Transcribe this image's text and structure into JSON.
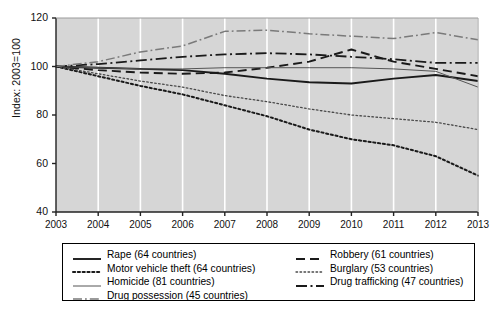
{
  "chart_data": {
    "type": "line",
    "title": "",
    "xlabel": "",
    "ylabel": "Index: 2003=100",
    "xlim": [
      2003,
      2013
    ],
    "ylim": [
      40,
      120
    ],
    "yticks": [
      40,
      60,
      80,
      100,
      120
    ],
    "grid": "vertical-white-gridlines",
    "legend_position": "below-plot",
    "x": [
      2003,
      2004,
      2005,
      2006,
      2007,
      2008,
      2009,
      2010,
      2011,
      2012,
      2013
    ],
    "categories": [
      "2003",
      "2004",
      "2005",
      "2006",
      "2007",
      "2008",
      "2009",
      "2010",
      "2011",
      "2012",
      "2013"
    ],
    "series": [
      {
        "name": "Rape (64 countries)",
        "label": "Rape (64 countries)",
        "countries": 64,
        "style": "solid-thick",
        "color": "#1a1a1a",
        "values": [
          100,
          99.5,
          99,
          98.5,
          97,
          95,
          93.5,
          93,
          95,
          96.5,
          94
        ]
      },
      {
        "name": "Robbery (61 countries)",
        "label": "Robbery (61 countries)",
        "countries": 61,
        "style": "long-dash",
        "color": "#1a1a1a",
        "values": [
          100,
          98.5,
          97.5,
          97,
          97.5,
          99.5,
          102,
          107,
          102,
          99,
          96
        ]
      },
      {
        "name": "Motor vehicle theft (64 countries)",
        "label": "Motor vehicle theft (64 countries)",
        "countries": 64,
        "style": "dotted-thick",
        "color": "#1a1a1a",
        "values": [
          100,
          96,
          92,
          88.5,
          84,
          79.5,
          74,
          70,
          67.5,
          63,
          55
        ]
      },
      {
        "name": "Burglary (53 countries)",
        "label": "Burglary (53 countries)",
        "countries": 53,
        "style": "dotted-fine",
        "color": "#4a4a4a",
        "values": [
          100,
          97,
          94,
          91.5,
          88,
          85.5,
          82.5,
          80,
          78.5,
          77,
          74
        ]
      },
      {
        "name": "Homicide (81 countries)",
        "label": "Homicide (81 countries)",
        "countries": 81,
        "style": "solid-thin",
        "color": "#555555",
        "values": [
          100,
          99.5,
          99,
          99,
          99.5,
          99.5,
          99.5,
          99.5,
          99,
          98,
          91.5
        ]
      },
      {
        "name": "Drug trafficking (47 countries)",
        "label": "Drug trafficking (47 countries)",
        "countries": 47,
        "style": "dash-dot-thick",
        "color": "#1a1a1a",
        "values": [
          100,
          101,
          102.5,
          104,
          105,
          105.5,
          105,
          104,
          103,
          101.5,
          101.5
        ]
      },
      {
        "name": "Drug possession (45 countries)",
        "label": "Drug possession (45 countries)",
        "countries": 45,
        "style": "dash-dot-gray",
        "color": "#7a7a7a",
        "values": [
          100,
          102,
          106,
          108.5,
          114.5,
          115,
          113.5,
          112.5,
          111.5,
          114,
          111
        ]
      }
    ]
  },
  "axes": {
    "ylabel": "Index: 2003=100",
    "yticks": [
      "120",
      "100",
      "80",
      "60",
      "40"
    ],
    "xticks": [
      "2003",
      "2004",
      "2005",
      "2006",
      "2007",
      "2008",
      "2009",
      "2010",
      "2011",
      "2012",
      "2013"
    ]
  },
  "legend": {
    "left_column": [
      "Rape (64 countries)",
      "Motor vehicle theft (64 countries)",
      "Homicide (81 countries)",
      "Drug possession (45 countries)"
    ],
    "right_column": [
      "Robbery (61 countries)",
      "Burglary (53 countries)",
      "Drug trafficking (47 countries)"
    ]
  },
  "colors": {
    "plot_background": "#d6d6d6",
    "gridline": "#ffffff",
    "axis": "#222222",
    "page_background": "#ffffff"
  }
}
